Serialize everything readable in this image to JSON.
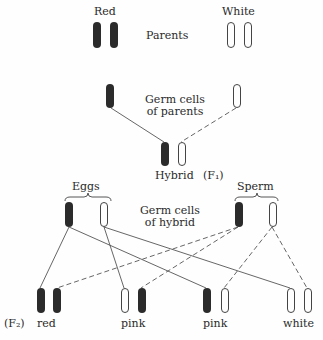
{
  "labels": {
    "red_parent": "Red",
    "white_parent": "White",
    "parents": "Parents",
    "germ_parents_1": "Germ cells",
    "germ_parents_2": "of parents",
    "hybrid": "Hybrid",
    "f1": "(F₁)",
    "eggs": "Eggs",
    "sperm": "Sperm",
    "germ_hybrid_1": "Germ cells",
    "germ_hybrid_2": "of hybrid",
    "f2": "(F₂)",
    "f2_red": "red",
    "f2_pink1": "pink",
    "f2_pink2": "pink",
    "f2_white": "white"
  },
  "colors": {
    "dark_chromosome": "#2b2b2b",
    "light_chromosome_stroke": "#444444",
    "line": "#555555"
  }
}
